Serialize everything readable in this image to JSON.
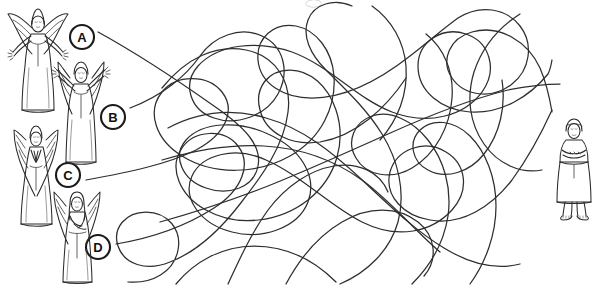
{
  "page": {
    "kind": "maze-puzzle-worksheet",
    "width": 610,
    "height": 285,
    "background_color": "#ffffff",
    "ink_color": "#2e2e2e",
    "label_color": "#111111"
  },
  "markers": [
    {
      "id": "a",
      "label": "A",
      "cx": 82,
      "cy": 37,
      "r": 12
    },
    {
      "id": "b",
      "label": "B",
      "cx": 113,
      "cy": 117,
      "r": 12
    },
    {
      "id": "c",
      "label": "C",
      "cx": 68,
      "cy": 175,
      "r": 12
    },
    {
      "id": "d",
      "label": "D",
      "cx": 98,
      "cy": 247,
      "r": 12
    }
  ],
  "figures": {
    "angels": [
      {
        "id": "angel-a",
        "marker": "A",
        "pose": "arms-spread-wide",
        "x": 8,
        "y": 8,
        "w": 62,
        "h": 112
      },
      {
        "id": "angel-b",
        "marker": "B",
        "pose": "arms-raised-up",
        "x": 52,
        "y": 58,
        "w": 58,
        "h": 108
      },
      {
        "id": "angel-c",
        "marker": "C",
        "pose": "hands-in-prayer",
        "x": 10,
        "y": 124,
        "w": 56,
        "h": 102
      },
      {
        "id": "angel-d",
        "marker": "D",
        "pose": "holding-object",
        "x": 50,
        "y": 188,
        "w": 56,
        "h": 96
      }
    ],
    "target": {
      "id": "standing-figure",
      "pose": "arms-crossed-robe",
      "x": 556,
      "y": 118,
      "w": 34,
      "h": 100
    }
  },
  "maze": {
    "line_count": 4,
    "start_side": "left",
    "end_side": "right",
    "paths": [
      {
        "from": "A",
        "start_x": 98,
        "start_y": 32,
        "end_x": 552,
        "end_y": 60
      },
      {
        "from": "B",
        "start_x": 130,
        "start_y": 108,
        "end_x": 545,
        "end_y": 110
      },
      {
        "from": "C",
        "start_x": 86,
        "start_y": 180,
        "end_x": 552,
        "end_y": 165
      },
      {
        "from": "D",
        "start_x": 116,
        "start_y": 244,
        "end_x": 500,
        "end_y": 246
      }
    ]
  }
}
